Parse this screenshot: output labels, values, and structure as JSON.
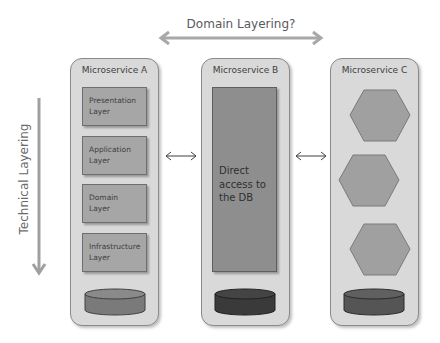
{
  "diagram": {
    "top_arrow": {
      "label": "Domain Layering?",
      "direction": "bidirectional-horizontal"
    },
    "side_arrow": {
      "label": "Technical Layering",
      "direction": "downward"
    },
    "services": [
      {
        "title": "Microservice A",
        "layers": [
          {
            "label": "Presentation Layer"
          },
          {
            "label": "Application Layer"
          },
          {
            "label": "Domain Layer"
          },
          {
            "label": "Infrastructure Layer"
          }
        ],
        "database": {
          "icon": "database-cylinder-icon",
          "color": "#7a7a7a"
        }
      },
      {
        "title": "Microservice B",
        "body": "Direct access to the DB",
        "database": {
          "icon": "database-cylinder-icon",
          "color": "#3a3a3a"
        }
      },
      {
        "title": "Microservice C",
        "hexagons": 3,
        "database": {
          "icon": "database-cylinder-icon",
          "color": "#555555"
        }
      }
    ],
    "connectors": [
      {
        "from": "Microservice A",
        "to": "Microservice B",
        "type": "bidirectional-arrow"
      },
      {
        "from": "Microservice B",
        "to": "Microservice C",
        "type": "bidirectional-arrow"
      }
    ],
    "colors": {
      "container": "#d9d9d9",
      "layer_box": "#a6a6a6",
      "hexagon": "#a0a0a0",
      "arrow": "#a8a8a8"
    }
  }
}
